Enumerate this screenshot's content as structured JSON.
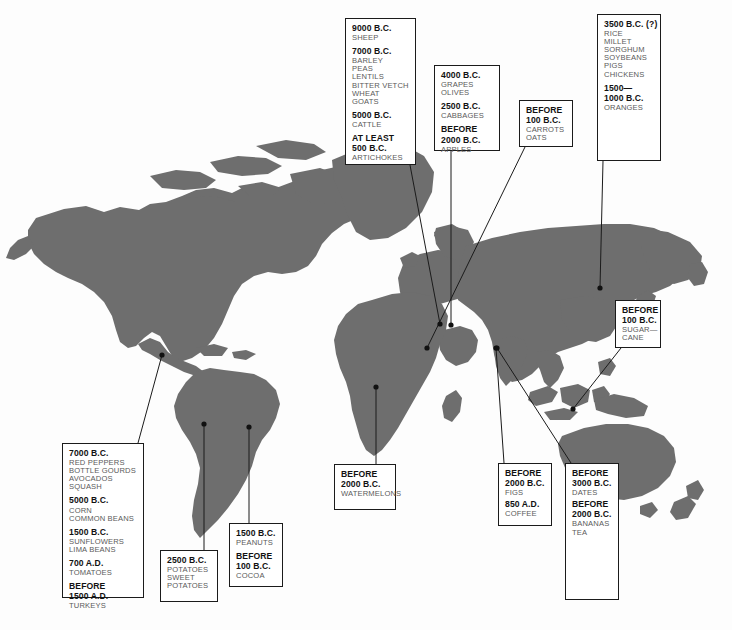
{
  "map": {
    "title": "Origins of Domesticated Crops and Animals",
    "land_color": "#6e6e6e",
    "ocean_color": "#fdfdfd",
    "line_color": "#1b1b1b"
  },
  "callouts": [
    {
      "id": "near-east",
      "region": "Near East / Fertile Crescent",
      "x": 345,
      "y": 18,
      "w": 71,
      "h": 147,
      "anchor_x": 440,
      "anchor_y": 324,
      "groups": [
        {
          "date": "9000 B.C.",
          "items": [
            "SHEEP"
          ]
        },
        {
          "date": "7000 B.C.",
          "items": [
            "BARLEY",
            "PEAS",
            "LENTILS",
            "BITTER VETCH",
            "WHEAT",
            "GOATS"
          ]
        },
        {
          "date": "5000 B.C.",
          "items": [
            "CATTLE"
          ]
        },
        {
          "date": "AT LEAST",
          "date2": "500 B.C.",
          "items": [
            "ARTICHOKES"
          ]
        }
      ]
    },
    {
      "id": "mediterranean",
      "region": "Mediterranean",
      "x": 434,
      "y": 65,
      "w": 66,
      "h": 86,
      "anchor_x": 451,
      "anchor_y": 325,
      "groups": [
        {
          "date": "4000 B.C.",
          "items": [
            "GRAPES",
            "OLIVES"
          ]
        },
        {
          "date": "2500 B.C.",
          "items": [
            "CABBAGES"
          ]
        },
        {
          "date": "BEFORE",
          "date2": "2000 B.C.",
          "items": [
            "APPLES"
          ]
        }
      ]
    },
    {
      "id": "central-asia",
      "region": "Central Asia",
      "x": 519,
      "y": 100,
      "w": 54,
      "h": 47,
      "anchor_x": 427,
      "anchor_y": 348,
      "groups": [
        {
          "date": "BEFORE",
          "date2": "100 B.C.",
          "items": [
            "CARROTS",
            "OATS"
          ]
        }
      ]
    },
    {
      "id": "china",
      "region": "China / East Asia",
      "x": 597,
      "y": 14,
      "w": 64,
      "h": 147,
      "anchor_x": 600,
      "anchor_y": 288,
      "groups": [
        {
          "date": "3500 B.C. (?)",
          "items": [
            "RICE",
            "MILLET",
            "SORGHUM",
            "SOYBEANS",
            "PIGS",
            "CHICKENS"
          ]
        },
        {
          "date": "1500—",
          "date2": "1000 B.C.",
          "items": [
            "ORANGES"
          ]
        }
      ]
    },
    {
      "id": "new-guinea",
      "region": "New Guinea / Southeast Asia",
      "x": 615,
      "y": 300,
      "w": 46,
      "h": 48,
      "anchor_x": 573,
      "anchor_y": 409,
      "groups": [
        {
          "date": "BEFORE",
          "date2": "100 B.C.",
          "items": [
            "SUGAR—",
            "CANE"
          ]
        }
      ]
    },
    {
      "id": "mesoamerica",
      "region": "Mesoamerica / North America",
      "x": 62,
      "y": 443,
      "w": 82,
      "h": 155,
      "anchor_x": 162,
      "anchor_y": 355,
      "groups": [
        {
          "date": "7000 B.C.",
          "items": [
            "RED PEPPERS",
            "BOTTLE GOURDS",
            "AVOCADOS",
            "SQUASH"
          ]
        },
        {
          "date": "5000 B.C.",
          "items": [
            "CORN",
            "COMMON BEANS"
          ]
        },
        {
          "date": "1500 B.C.",
          "items": [
            "SUNFLOWERS",
            "LIMA BEANS"
          ]
        },
        {
          "date": "700 A.D.",
          "items": [
            "TOMATOES"
          ]
        },
        {
          "date": "BEFORE",
          "date2": "1500 A.D.",
          "items": [
            "TURKEYS"
          ]
        }
      ]
    },
    {
      "id": "andes",
      "region": "Andes",
      "x": 160,
      "y": 550,
      "w": 58,
      "h": 52,
      "anchor_x": 204,
      "anchor_y": 424,
      "groups": [
        {
          "date": "2500 B.C.",
          "items": [
            "POTATOES",
            "SWEET",
            "POTATOES"
          ]
        }
      ]
    },
    {
      "id": "brazil",
      "region": "Brazil / Amazonia",
      "x": 229,
      "y": 523,
      "w": 54,
      "h": 64,
      "anchor_x": 249,
      "anchor_y": 427,
      "groups": [
        {
          "date": "1500 B.C.",
          "items": [
            "PEANUTS"
          ]
        },
        {
          "date": "BEFORE",
          "date2": "100 B.C.",
          "items": [
            "COCOA"
          ]
        }
      ]
    },
    {
      "id": "africa",
      "region": "Africa",
      "x": 334,
      "y": 464,
      "w": 62,
      "h": 46,
      "anchor_x": 376,
      "anchor_y": 387,
      "groups": [
        {
          "date": "BEFORE",
          "date2": "2000 B.C.",
          "items": [
            "WATERMELONS"
          ]
        }
      ]
    },
    {
      "id": "arabia",
      "region": "Arabia / Ethiopia",
      "x": 498,
      "y": 463,
      "w": 54,
      "h": 63,
      "anchor_x": 496,
      "anchor_y": 348,
      "groups": [
        {
          "date": "BEFORE",
          "date2": "2000 B.C.",
          "items": [
            "FIGS"
          ]
        },
        {
          "date": "850 A.D.",
          "items": [
            "COFFEE"
          ]
        }
      ]
    },
    {
      "id": "india",
      "region": "India / South Asia",
      "x": 565,
      "y": 463,
      "w": 54,
      "h": 137,
      "anchor_x": 497,
      "anchor_y": 348,
      "groups": [
        {
          "date": "BEFORE",
          "date2": "3000 B.C.",
          "items": [
            "DATES"
          ]
        },
        {
          "date": "BEFORE",
          "date2": "2000 B.C.",
          "items": [
            "BANANAS",
            "TEA"
          ]
        }
      ]
    }
  ]
}
